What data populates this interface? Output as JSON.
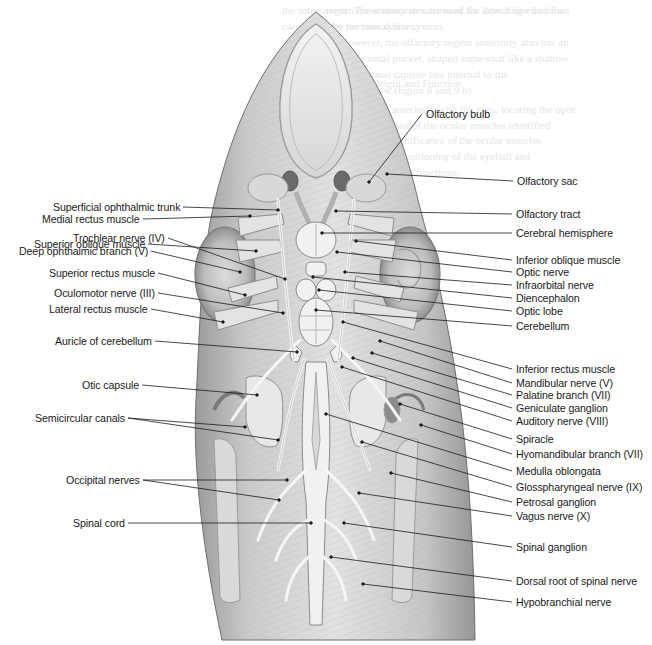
{
  "figure": {
    "background": "#ffffff",
    "label_color": "#1a1a1a",
    "line_color": "#1a1a1a",
    "illustration_tone": "#b8b8b8"
  },
  "labels_left": [
    {
      "text": "Superficial ophthalmic trunk",
      "x": 180,
      "y": 207,
      "tx": 278,
      "ty": 210
    },
    {
      "text": "Medial rectus muscle",
      "x": 140,
      "y": 219,
      "tx": 250,
      "ty": 216
    },
    {
      "text": "Superior oblique muscle",
      "x": 145,
      "y": 244,
      "tx": 256,
      "ty": 251
    },
    {
      "text": "Trochlear nerve (IV)",
      "x": 165,
      "y": 238,
      "tx": 285,
      "ty": 279
    },
    {
      "text": "Deep ophthalmic branch (V)",
      "x": 148,
      "y": 251,
      "tx": 240,
      "ty": 272
    },
    {
      "text": "Superior rectus muscle",
      "x": 155,
      "y": 273,
      "tx": 245,
      "ty": 295
    },
    {
      "text": "Oculomotor nerve (III)",
      "x": 155,
      "y": 293,
      "tx": 283,
      "ty": 313
    },
    {
      "text": "Lateral rectus muscle",
      "x": 148,
      "y": 309,
      "tx": 223,
      "ty": 322
    },
    {
      "text": "Auricle of cerebellum",
      "x": 152,
      "y": 341,
      "tx": 297,
      "ty": 352
    },
    {
      "text": "Otic capsule",
      "x": 139,
      "y": 385,
      "tx": 257,
      "ty": 395
    },
    {
      "text": "Semicircular canals",
      "x": 125,
      "y": 418,
      "tx": 245,
      "ty": 427
    },
    {
      "text": "",
      "x": 125,
      "y": 418,
      "tx": 278,
      "ty": 440
    },
    {
      "text": "Occipital nerves",
      "x": 140,
      "y": 480,
      "tx": 287,
      "ty": 480
    },
    {
      "text": "",
      "x": 140,
      "y": 480,
      "tx": 279,
      "ty": 500
    },
    {
      "text": "Spinal cord",
      "x": 125,
      "y": 523,
      "tx": 311,
      "ty": 523
    }
  ],
  "labels_right": [
    {
      "text": "Olfactory bulb",
      "x": 426,
      "y": 114,
      "tx": 369,
      "ty": 182
    },
    {
      "text": "Olfactory sac",
      "x": 517,
      "y": 181,
      "tx": 387,
      "ty": 174
    },
    {
      "text": "Olfactory tract",
      "x": 516,
      "y": 214,
      "tx": 336,
      "ty": 211
    },
    {
      "text": "Cerebral hemisphere",
      "x": 516,
      "y": 233,
      "tx": 322,
      "ty": 233
    },
    {
      "text": "Inferior oblique muscle",
      "x": 516,
      "y": 260,
      "tx": 356,
      "ty": 241
    },
    {
      "text": "Optic nerve",
      "x": 516,
      "y": 272,
      "tx": 337,
      "ty": 252
    },
    {
      "text": "Infraorbital nerve",
      "x": 516,
      "y": 285,
      "tx": 345,
      "ty": 272
    },
    {
      "text": "Diencephalon",
      "x": 516,
      "y": 298,
      "tx": 313,
      "ty": 277
    },
    {
      "text": "Optic lobe",
      "x": 516,
      "y": 311,
      "tx": 319,
      "ty": 290
    },
    {
      "text": "Cerebellum",
      "x": 516,
      "y": 326,
      "tx": 316,
      "ty": 310
    },
    {
      "text": "Inferior rectus muscle",
      "x": 516,
      "y": 369,
      "tx": 343,
      "ty": 322
    },
    {
      "text": "Mandibular nerve (V)",
      "x": 516,
      "y": 383,
      "tx": 380,
      "ty": 341
    },
    {
      "text": "Palatine branch (VII)",
      "x": 516,
      "y": 395,
      "tx": 372,
      "ty": 353
    },
    {
      "text": "Geniculate ganglion",
      "x": 516,
      "y": 408,
      "tx": 353,
      "ty": 358
    },
    {
      "text": "Auditory nerve (VIII)",
      "x": 516,
      "y": 421,
      "tx": 342,
      "ty": 367
    },
    {
      "text": "Spiracle",
      "x": 516,
      "y": 439,
      "tx": 400,
      "ty": 404
    },
    {
      "text": "Hyomandibular branch (VII)",
      "x": 516,
      "y": 454,
      "tx": 421,
      "ty": 425
    },
    {
      "text": "Medulla oblongata",
      "x": 516,
      "y": 471,
      "tx": 326,
      "ty": 414
    },
    {
      "text": "Glosspharyngeal nerve (IX)",
      "x": 516,
      "y": 487,
      "tx": 362,
      "ty": 442
    },
    {
      "text": "Petrosal ganglion",
      "x": 516,
      "y": 502,
      "tx": 391,
      "ty": 473
    },
    {
      "text": "Vagus nerve (X)",
      "x": 516,
      "y": 516,
      "tx": 359,
      "ty": 493
    },
    {
      "text": "Spinal ganglion",
      "x": 516,
      "y": 547,
      "tx": 344,
      "ty": 523
    },
    {
      "text": "Dorsal root of spinal nerve",
      "x": 516,
      "y": 581,
      "tx": 331,
      "ty": 557
    },
    {
      "text": "Hypobranchial nerve",
      "x": 516,
      "y": 602,
      "tx": 363,
      "ty": 584
    }
  ],
  "ghost_text": [
    {
      "text": "the integument. These structures are used for detecting vibrations",
      "x": 282,
      "y": 4
    },
    {
      "text": "carried out by the lateral line system.",
      "x": 282,
      "y": 20
    },
    {
      "text": "Anatomy",
      "x": 300,
      "y": 56
    },
    {
      "text": "Cranial Nerves: Origin and Function",
      "x": 300,
      "y": 77
    },
    {
      "text": "Begin the dissection anteriorly with the eyes, locating the optic",
      "x": 300,
      "y": 103
    },
    {
      "text": "nerves and the insertions of the ocular muscles identified",
      "x": 300,
      "y": 119
    },
    {
      "text": "in figure 8. Note the significance of the ocular muscles",
      "x": 300,
      "y": 134
    },
    {
      "text": "for the movement and positioning of the eyeball and",
      "x": 300,
      "y": 150
    },
    {
      "text": "relate the muscles to their functions.",
      "x": 300,
      "y": 166
    },
    {
      "text": "region for sensory structures of the lateral line and the",
      "x": 326,
      "y": 4
    },
    {
      "text": "the nervous system.",
      "x": 330,
      "y": 20
    },
    {
      "text": "However, the olfactory region anteriorly also has an",
      "x": 340,
      "y": 36
    },
    {
      "text": "anterior nasal pocket, shaped somewhat like a shallow",
      "x": 330,
      "y": 52
    },
    {
      "text": "cup; the nasal capsule lies internal to the",
      "x": 330,
      "y": 68
    },
    {
      "text": "Anterior view (figure 8 and 9 b).",
      "x": 330,
      "y": 84
    },
    {
      "text": "Structure",
      "x": 326,
      "y": 124
    },
    {
      "text": "External Anatomy",
      "x": 330,
      "y": 163
    }
  ]
}
